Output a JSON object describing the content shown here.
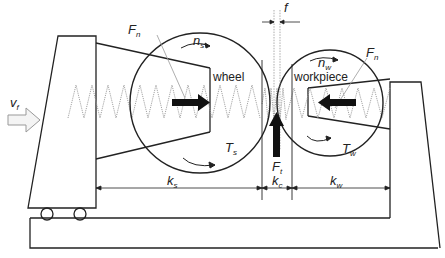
{
  "diagram": {
    "type": "grinding-system-schematic",
    "labels": {
      "feed_velocity": {
        "base": "v",
        "sub": "f"
      },
      "normal_force_wheel": {
        "base": "F",
        "sub": "n"
      },
      "normal_force_workpiece": {
        "base": "F",
        "sub": "n"
      },
      "wheel_speed": {
        "base": "n",
        "sub": "s"
      },
      "workpiece_speed": {
        "base": "n",
        "sub": "w"
      },
      "wheel_torque": {
        "base": "T",
        "sub": "s"
      },
      "workpiece_torque": {
        "base": "T",
        "sub": "w"
      },
      "tangential_force": {
        "base": "F",
        "sub": "t"
      },
      "wheel_stiffness": {
        "base": "k",
        "sub": "s"
      },
      "contact_stiffness": {
        "base": "k",
        "sub": "c"
      },
      "workpiece_stiffness": {
        "base": "k",
        "sub": "w"
      },
      "gap": "f",
      "wheel_name": "wheel",
      "workpiece_name": "workpiece"
    },
    "colors": {
      "line": "#222222",
      "spring": "#999999",
      "arrow_fill": "#111111",
      "feed_arrow_fill": "#f4f4f4"
    }
  }
}
